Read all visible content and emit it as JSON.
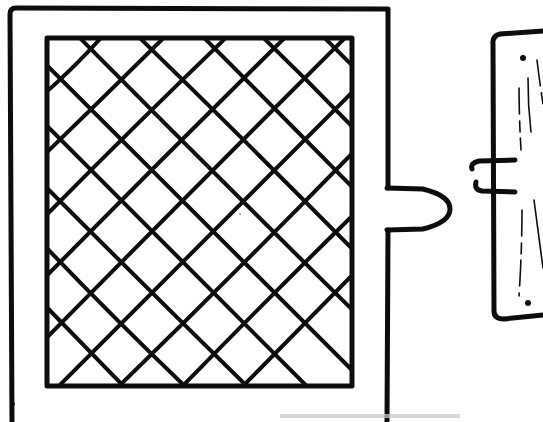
{
  "figure": {
    "kind": "line-drawing",
    "background_color": "#ffffff",
    "ink_color": "#0d0d0d",
    "faint_ink_color": "#c9c9c9",
    "canvas": {
      "width": 543,
      "height": 422
    }
  },
  "door": {
    "label": "door",
    "outer_frame": {
      "label": "outer door frame",
      "x": 10,
      "y": 8,
      "width": 378,
      "height": 414,
      "stroke_width": 5,
      "corner_radius": 6
    },
    "inner_panel": {
      "label": "lattice panel opening",
      "x": 47,
      "y": 38,
      "width": 305,
      "height": 348,
      "stroke_width": 5
    },
    "lattice": {
      "label": "diamond lattice grille",
      "angle_degrees": 45,
      "pitch": 61,
      "stroke_width": 4,
      "columns_across": 5,
      "rows_down": 6,
      "down_right_offsets": [
        -348,
        -287,
        -226,
        -165,
        -104,
        -43,
        18,
        79,
        140,
        201,
        262
      ],
      "down_left_offsets": [
        -43,
        18,
        79,
        140,
        201,
        262,
        323,
        384,
        445,
        506,
        567,
        628
      ]
    },
    "latch_bolt": {
      "label": "spring latch bolt",
      "x": 388,
      "y": 188,
      "width": 62,
      "height": 42,
      "stroke_width": 5,
      "tip_style": "tapered-point"
    }
  },
  "jamb": {
    "label": "door jamb strike plate",
    "body": {
      "x": 492,
      "y": 30,
      "width": 52,
      "height": 289,
      "stroke_width": 5,
      "corner_radius": 8
    },
    "strike_opening": {
      "label": "strike plate mortise",
      "x": 470,
      "y": 160,
      "width": 45,
      "height": 32,
      "stroke_width": 5
    },
    "screw_holes": [
      {
        "label": "upper screw hole",
        "cx": 523,
        "cy": 58,
        "r": 3
      },
      {
        "label": "lower screw hole",
        "cx": 528,
        "cy": 303,
        "r": 3
      }
    ],
    "grain_lines": [
      {
        "label": "grain-1",
        "x1": 519,
        "y1": 88,
        "x2": 521,
        "y2": 150
      },
      {
        "label": "grain-2",
        "x1": 528,
        "y1": 78,
        "x2": 531,
        "y2": 132
      },
      {
        "label": "grain-3",
        "x1": 522,
        "y1": 210,
        "x2": 519,
        "y2": 296
      },
      {
        "label": "grain-4",
        "x1": 534,
        "y1": 200,
        "x2": 543,
        "y2": 268
      },
      {
        "label": "grain-5",
        "x1": 537,
        "y1": 60,
        "x2": 543,
        "y2": 104
      }
    ]
  },
  "artifacts": {
    "label": "scan artifacts",
    "smudge": {
      "x": 280,
      "y": 414,
      "width": 180,
      "height": 4
    },
    "speck_left": {
      "cx": 13,
      "cy": 404,
      "r": 2
    },
    "speck_panel": {
      "cx": 240,
      "cy": 214,
      "r": 1
    }
  }
}
